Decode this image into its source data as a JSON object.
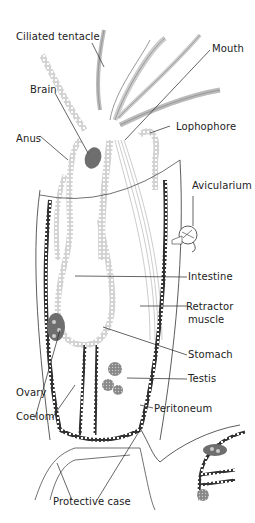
{
  "diagram": {
    "colors": {
      "line": "#2a2a2a",
      "tissue": "#9a9a9a",
      "organ": "#6e6e6e",
      "background": "#ffffff"
    },
    "labels": {
      "ciliated_tentacle": "Ciliated tentacle",
      "mouth": "Mouth",
      "brain": "Brain",
      "lophophore": "Lophophore",
      "anus": "Anus",
      "avicularium": "Avicularium",
      "intestine": "Intestine",
      "retractor_muscle_1": "Retractor",
      "retractor_muscle_2": "muscle",
      "stomach": "Stomach",
      "testis": "Testis",
      "ovary": "Ovary",
      "coelom": "Coelom",
      "peritoneum": "Peritoneum",
      "protective_case": "Protective case"
    }
  }
}
